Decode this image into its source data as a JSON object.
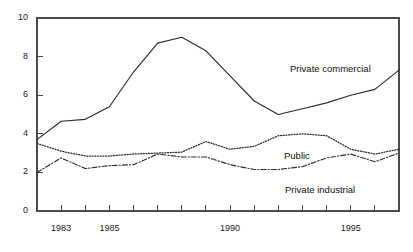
{
  "chart_data": {
    "type": "line",
    "title": "",
    "subtitle": "",
    "xlabel": "",
    "ylabel": "",
    "xlim": [
      1982,
      1997
    ],
    "ylim": [
      0,
      10
    ],
    "grid": false,
    "legend_position": "inline-annotations",
    "x": [
      1982,
      1983,
      1984,
      1985,
      1986,
      1987,
      1988,
      1989,
      1990,
      1991,
      1992,
      1993,
      1994,
      1995,
      1996,
      1997
    ],
    "y_ticks": [
      0,
      2,
      4,
      6,
      8,
      10
    ],
    "y_tick_labels": [
      "0",
      "2",
      "4",
      "6",
      "8",
      "10"
    ],
    "x_tick_values": [
      1982,
      1983,
      1984,
      1985,
      1986,
      1987,
      1988,
      1989,
      1990,
      1991,
      1992,
      1993,
      1994,
      1995,
      1996,
      1997
    ],
    "x_tick_labels_shown": [
      {
        "value": 1983,
        "label": "1983"
      },
      {
        "value": 1985,
        "label": "1985"
      },
      {
        "value": 1990,
        "label": "1990"
      },
      {
        "value": 1995,
        "label": "1995"
      }
    ],
    "series": [
      {
        "name": "Private commercial",
        "style": "solid",
        "values": [
          3.7,
          4.65,
          4.75,
          5.4,
          7.2,
          8.7,
          9.0,
          8.3,
          7.0,
          5.7,
          5.0,
          5.3,
          5.6,
          6.0,
          6.3,
          7.3
        ],
        "annotation": {
          "label": "Private commercial",
          "x": 290,
          "y": 63
        }
      },
      {
        "name": "Public",
        "style": "dotted",
        "values": [
          3.5,
          3.1,
          2.85,
          2.85,
          2.95,
          3.0,
          3.05,
          3.6,
          3.2,
          3.35,
          3.9,
          4.0,
          3.9,
          3.2,
          2.95,
          3.2
        ],
        "annotation": {
          "label": "Public",
          "x": 284,
          "y": 150
        }
      },
      {
        "name": "Private industrial",
        "style": "dashdot",
        "values": [
          2.0,
          2.75,
          2.2,
          2.35,
          2.4,
          2.95,
          2.8,
          2.8,
          2.4,
          2.15,
          2.15,
          2.3,
          2.75,
          2.95,
          2.55,
          3.0
        ],
        "annotation": {
          "label": "Private industrial",
          "x": 285,
          "y": 184
        }
      }
    ]
  },
  "colors": {
    "axis": "#4a4a4a",
    "line": "#2b2b2b",
    "text": "#1a1a1a",
    "background": "#ffffff"
  },
  "geometry": {
    "plot_left": 37,
    "plot_right": 399,
    "plot_top": 18,
    "plot_bottom": 211
  }
}
